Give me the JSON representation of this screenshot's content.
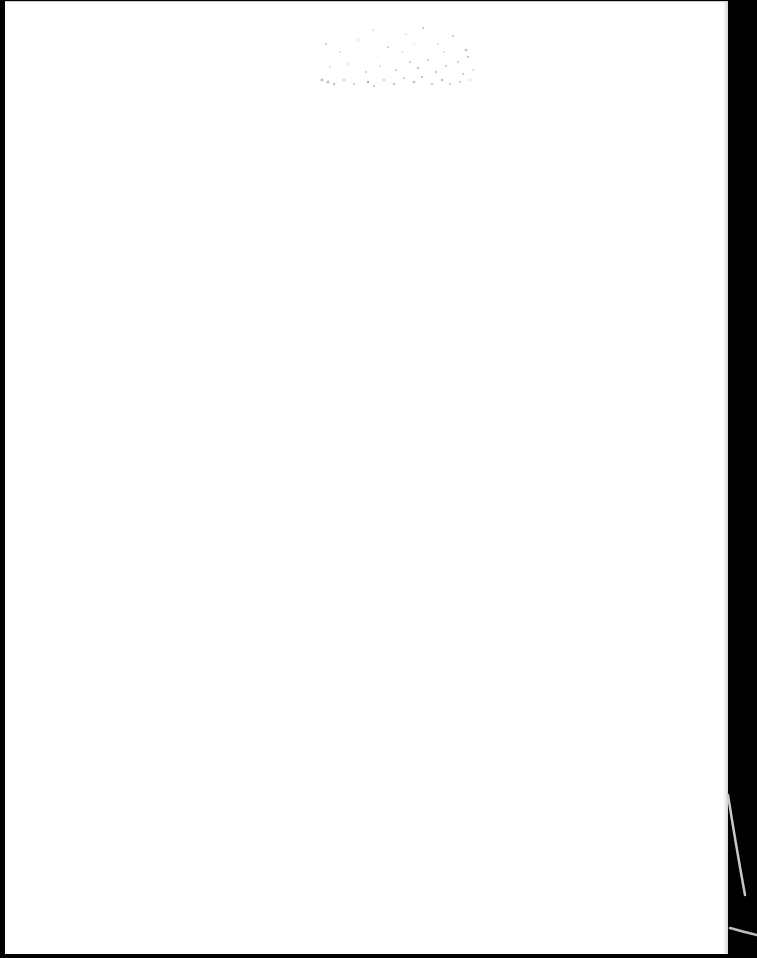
{
  "document": {
    "type": "scanned-page",
    "content_text": "",
    "page_state": "blank",
    "colors": {
      "page": "#ffffff",
      "scan_border": "#000000",
      "speckle": "#9a9a9a",
      "edge_line": "#c8c8c8"
    },
    "artifacts": [
      {
        "name": "speckle-noise-patch",
        "region": "top-center"
      },
      {
        "name": "page-curl-line",
        "region": "bottom-right"
      }
    ]
  }
}
